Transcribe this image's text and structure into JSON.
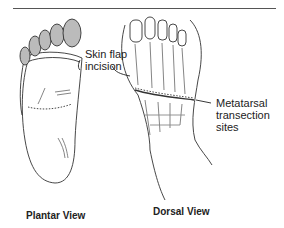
{
  "figure": {
    "labels": {
      "skin_flap_line1": "Skin flap",
      "skin_flap_line2": "incision",
      "metatarsal_line1": "Metatarsal",
      "metatarsal_line2": "transection",
      "metatarsal_line3": "sites"
    },
    "views": {
      "plantar": "Plantar View",
      "dorsal": "Dorsal View"
    }
  }
}
